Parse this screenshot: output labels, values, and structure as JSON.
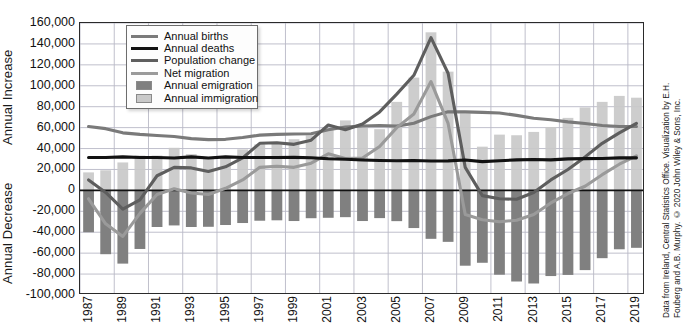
{
  "axis_titles": {
    "increase": "Annual Increase",
    "decrease": "Annual Decrease"
  },
  "credit": {
    "line1": "Data from Ireland, Central Statistics Office. Visualization by E.H.",
    "line2": "Fouberg and A.B. Murphy. © 2020 John Wiley & Sons, Inc."
  },
  "legend": {
    "position": "inside-top-left",
    "items": [
      {
        "label": "Annual births",
        "type": "line",
        "color": "#7a7a7a",
        "width": 3.2
      },
      {
        "label": "Annual deaths",
        "type": "line",
        "color": "#121212",
        "width": 3.2
      },
      {
        "label": "Population change",
        "type": "line",
        "color": "#5e5e5e",
        "width": 3.2
      },
      {
        "label": "Net migration",
        "type": "line",
        "color": "#9a9a9a",
        "width": 3.2
      },
      {
        "label": "Annual emigration",
        "type": "bar",
        "color": "#808080"
      },
      {
        "label": "Annual immigration",
        "type": "bar",
        "color": "#c9c9c9"
      }
    ]
  },
  "chart_data": {
    "type": "bar",
    "title": "",
    "xlabel": "",
    "ylabel": "Annual Increase / Annual Decrease",
    "ylim": [
      -100000,
      160000
    ],
    "ytick_step": 20000,
    "ytick_labels": [
      "160,000",
      "140,000",
      "120,000",
      "100,000",
      "80,000",
      "60,000",
      "40,000",
      "20,000",
      "0",
      "-20,000",
      "-40,000",
      "-60,000",
      "-80,000",
      "-100,000"
    ],
    "ytick_values": [
      160000,
      140000,
      120000,
      100000,
      80000,
      60000,
      40000,
      20000,
      0,
      -20000,
      -40000,
      -60000,
      -80000,
      -100000
    ],
    "grid": true,
    "zero_line": 0,
    "x": [
      1987,
      1988,
      1989,
      1990,
      1991,
      1992,
      1993,
      1994,
      1995,
      1996,
      1997,
      1998,
      1999,
      2000,
      2001,
      2002,
      2003,
      2004,
      2005,
      2006,
      2007,
      2008,
      2009,
      2010,
      2011,
      2012,
      2013,
      2014,
      2015,
      2016,
      2017,
      2018,
      2019
    ],
    "xtick_labels": [
      "1987",
      "1989",
      "1991",
      "1993",
      "1995",
      "1997",
      "1999",
      "2001",
      "2003",
      "2005",
      "2007",
      "2009",
      "2011",
      "2013",
      "2015",
      "2017",
      "2019"
    ],
    "xtick_values": [
      1987,
      1989,
      1991,
      1993,
      1995,
      1997,
      1999,
      2001,
      2003,
      2005,
      2007,
      2009,
      2011,
      2013,
      2015,
      2017,
      2019
    ],
    "series": [
      {
        "name": "Annual births",
        "kind": "line",
        "color": "#7a7a7a",
        "values": [
          61000,
          59000,
          55000,
          53500,
          52500,
          51500,
          49500,
          48500,
          48800,
          50500,
          52800,
          53500,
          53900,
          54200,
          57900,
          60500,
          61500,
          62000,
          61400,
          64200,
          70500,
          75100,
          75000,
          74600,
          74000,
          71700,
          68900,
          67500,
          65500,
          63900,
          62000,
          61000,
          61000
        ]
      },
      {
        "name": "Annual deaths",
        "kind": "line",
        "color": "#121212",
        "values": [
          31500,
          31500,
          32000,
          31500,
          31500,
          31000,
          32000,
          31000,
          32000,
          31500,
          31500,
          31500,
          31600,
          31200,
          30200,
          29700,
          29100,
          28600,
          28300,
          28500,
          28100,
          28200,
          29000,
          27500,
          28300,
          29200,
          29500,
          29200,
          30100,
          30400,
          30500,
          31100,
          31100
        ]
      },
      {
        "name": "Population change",
        "kind": "line",
        "color": "#5e5e5e",
        "values": [
          10000,
          -2000,
          -18000,
          -9000,
          14000,
          22000,
          21500,
          18000,
          22500,
          31000,
          45000,
          45500,
          44000,
          48000,
          62500,
          58000,
          63500,
          75000,
          92000,
          110000,
          146000,
          112000,
          22000,
          -5000,
          -8000,
          -8500,
          -2000,
          10000,
          20000,
          32000,
          45000,
          55000,
          64000
        ]
      },
      {
        "name": "Net migration",
        "kind": "line",
        "color": "#9a9a9a",
        "values": [
          -8000,
          -32000,
          -44000,
          -22000,
          -4000,
          1500,
          -2500,
          -4000,
          2000,
          10000,
          22000,
          23000,
          22000,
          26000,
          35000,
          30500,
          31000,
          42000,
          60000,
          73000,
          104000,
          64000,
          -23000,
          -28000,
          -30000,
          -28500,
          -23000,
          -12000,
          -3000,
          4000,
          15000,
          25000,
          33000
        ]
      },
      {
        "name": "Annual emigration",
        "kind": "bar",
        "color": "#808080",
        "values": [
          -40000,
          -61000,
          -70000,
          -56000,
          -35000,
          -33500,
          -35000,
          -34800,
          -33100,
          -31200,
          -29000,
          -28600,
          -29300,
          -26600,
          -26200,
          -25600,
          -29300,
          -26500,
          -29400,
          -36000,
          -46300,
          -49200,
          -72000,
          -69200,
          -80600,
          -87100,
          -89000,
          -81900,
          -80800,
          -76200,
          -64800,
          -56300,
          -54900
        ]
      },
      {
        "name": "Annual immigration",
        "kind": "bar",
        "color": "#c9c9c9",
        "values": [
          17200,
          19200,
          26700,
          33300,
          33300,
          40700,
          34700,
          30100,
          31200,
          39200,
          44000,
          46000,
          48900,
          52600,
          59000,
          66900,
          60000,
          58500,
          84600,
          107800,
          151100,
          113500,
          73700,
          41800,
          53300,
          52700,
          55900,
          60600,
          69300,
          79300,
          84600,
          90300,
          88600
        ]
      }
    ],
    "annotations": []
  }
}
